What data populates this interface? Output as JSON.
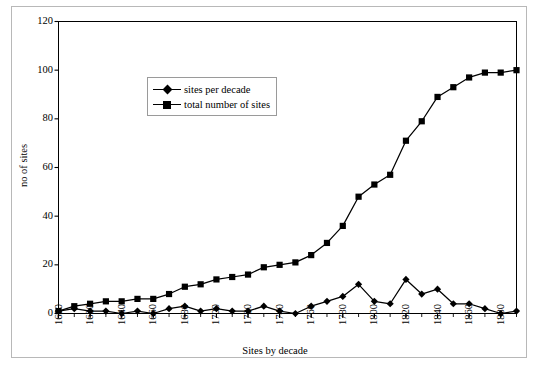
{
  "chart_data": {
    "type": "line",
    "title": "",
    "xlabel": "Sites by decade",
    "ylabel": "no of sites",
    "xlim": [
      1600,
      1890
    ],
    "ylim": [
      0,
      120
    ],
    "ytick_labels": [
      "0",
      "20",
      "40",
      "60",
      "80",
      "100",
      "120"
    ],
    "yticks": [
      0,
      20,
      40,
      60,
      80,
      100,
      120
    ],
    "xtick_labels": [
      "1600",
      "1620",
      "1640",
      "1660",
      "1680",
      "1700",
      "1720",
      "1740",
      "1760",
      "1780",
      "1800",
      "1820",
      "1840",
      "1860",
      "1880"
    ],
    "xticks": [
      1600,
      1620,
      1640,
      1660,
      1680,
      1700,
      1720,
      1740,
      1760,
      1780,
      1800,
      1820,
      1840,
      1860,
      1880
    ],
    "x": [
      1600,
      1610,
      1620,
      1630,
      1640,
      1650,
      1660,
      1670,
      1680,
      1690,
      1700,
      1710,
      1720,
      1730,
      1740,
      1750,
      1760,
      1770,
      1780,
      1790,
      1800,
      1810,
      1820,
      1830,
      1840,
      1850,
      1860,
      1870,
      1880,
      1890
    ],
    "grid": false,
    "legend_position": "upper-left-inset",
    "series": [
      {
        "name": "sites per decade",
        "marker": "diamond",
        "color": "#000000",
        "values": [
          1,
          2,
          1,
          1,
          0,
          1,
          0,
          2,
          3,
          1,
          2,
          1,
          1,
          3,
          1,
          0,
          3,
          5,
          7,
          12,
          5,
          4,
          14,
          8,
          10,
          4,
          4,
          2,
          0,
          1
        ]
      },
      {
        "name": "total number of sites",
        "marker": "square",
        "color": "#000000",
        "values": [
          1,
          3,
          4,
          5,
          5,
          6,
          6,
          8,
          11,
          12,
          14,
          15,
          16,
          19,
          20,
          21,
          24,
          29,
          36,
          48,
          53,
          57,
          71,
          79,
          89,
          93,
          97,
          99,
          99,
          100
        ]
      }
    ]
  },
  "legend": {
    "items": [
      {
        "label": "sites per decade",
        "marker": "diamond"
      },
      {
        "label": "total number of sites",
        "marker": "square"
      }
    ]
  }
}
